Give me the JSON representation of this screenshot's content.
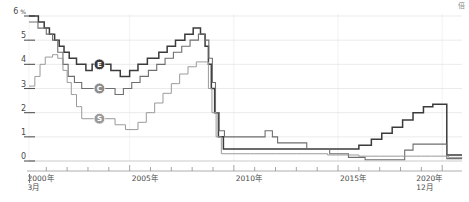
{
  "meta": {
    "corner_mark": "倍"
  },
  "chart_data": {
    "type": "line",
    "title": "",
    "subtitle": "",
    "xlabel": "",
    "ylabel": "%",
    "ylim": [
      0,
      6
    ],
    "xlim": [
      2000.17,
      2020.95
    ],
    "grid": true,
    "legend_position": "inline-markers",
    "y_unit_label": "%",
    "y_ticks": [
      0,
      1,
      2,
      3,
      4,
      5,
      6
    ],
    "y_tick_labels": [
      "0",
      "1",
      "2",
      "3",
      "4",
      "5",
      "6"
    ],
    "x_ticks": [
      2000,
      2001,
      2002,
      2003,
      2004,
      2005,
      2006,
      2007,
      2008,
      2009,
      2010,
      2011,
      2012,
      2013,
      2014,
      2015,
      2016,
      2017,
      2018,
      2019,
      2020
    ],
    "x_tick_labels": [
      {
        "value": 2000,
        "label": "2000年",
        "sub": "3月"
      },
      {
        "value": 2005,
        "label": "2005年",
        "sub": ""
      },
      {
        "value": 2010,
        "label": "2010年",
        "sub": ""
      },
      {
        "value": 2015,
        "label": "2015年",
        "sub": ""
      },
      {
        "value": 2020,
        "label": "2020年",
        "sub": "12月"
      }
    ],
    "markers": [
      {
        "id": "E",
        "label": "E",
        "x": 2003.55,
        "y": 4.0,
        "color": "#3b3b3b"
      },
      {
        "id": "C",
        "label": "C",
        "x": 2003.55,
        "y": 3.0,
        "color": "#8c8c8c"
      },
      {
        "id": "S",
        "label": "S",
        "x": 2003.55,
        "y": 1.75,
        "color": "#9a9a9a"
      }
    ],
    "series": [
      {
        "name": "E",
        "color": "#3b3b3b",
        "width": 1.5,
        "points": [
          [
            2000.17,
            6.0
          ],
          [
            2000.6,
            6.0
          ],
          [
            2000.62,
            5.75
          ],
          [
            2000.85,
            5.75
          ],
          [
            2000.9,
            5.5
          ],
          [
            2001.05,
            5.5
          ],
          [
            2001.15,
            5.25
          ],
          [
            2001.3,
            5.25
          ],
          [
            2001.4,
            5.0
          ],
          [
            2001.55,
            5.0
          ],
          [
            2001.62,
            4.75
          ],
          [
            2001.78,
            4.75
          ],
          [
            2001.85,
            4.5
          ],
          [
            2002.0,
            4.5
          ],
          [
            2002.1,
            4.25
          ],
          [
            2002.3,
            4.25
          ],
          [
            2002.45,
            4.0
          ],
          [
            2002.8,
            4.0
          ],
          [
            2002.9,
            3.75
          ],
          [
            2003.1,
            3.75
          ],
          [
            2003.2,
            4.0
          ],
          [
            2003.55,
            4.0
          ],
          [
            2003.7,
            4.0
          ],
          [
            2004.0,
            4.0
          ],
          [
            2004.1,
            3.75
          ],
          [
            2004.45,
            3.75
          ],
          [
            2004.55,
            3.5
          ],
          [
            2004.9,
            3.5
          ],
          [
            2005.0,
            3.75
          ],
          [
            2005.3,
            3.75
          ],
          [
            2005.4,
            4.0
          ],
          [
            2005.75,
            4.0
          ],
          [
            2005.85,
            4.25
          ],
          [
            2006.3,
            4.25
          ],
          [
            2006.4,
            4.5
          ],
          [
            2006.7,
            4.5
          ],
          [
            2006.8,
            4.75
          ],
          [
            2007.1,
            4.75
          ],
          [
            2007.2,
            5.0
          ],
          [
            2007.55,
            5.0
          ],
          [
            2007.65,
            5.25
          ],
          [
            2007.95,
            5.25
          ],
          [
            2008.05,
            5.5
          ],
          [
            2008.3,
            5.5
          ],
          [
            2008.4,
            5.25
          ],
          [
            2008.55,
            5.25
          ],
          [
            2008.62,
            4.75
          ],
          [
            2008.72,
            4.75
          ],
          [
            2008.78,
            4.0
          ],
          [
            2008.86,
            4.0
          ],
          [
            2008.92,
            3.0
          ],
          [
            2009.0,
            3.0
          ],
          [
            2009.08,
            2.0
          ],
          [
            2009.18,
            2.0
          ],
          [
            2009.26,
            1.0
          ],
          [
            2009.4,
            1.0
          ],
          [
            2009.5,
            0.5
          ],
          [
            2010.0,
            0.5
          ],
          [
            2010.5,
            0.5
          ],
          [
            2011.0,
            0.5
          ],
          [
            2011.5,
            0.5
          ],
          [
            2012.0,
            0.5
          ],
          [
            2012.5,
            0.5
          ],
          [
            2013.0,
            0.5
          ],
          [
            2013.5,
            0.5
          ],
          [
            2014.0,
            0.5
          ],
          [
            2014.5,
            0.5
          ],
          [
            2015.0,
            0.5
          ],
          [
            2015.5,
            0.5
          ],
          [
            2015.9,
            0.5
          ],
          [
            2016.0,
            0.65
          ],
          [
            2016.5,
            0.65
          ],
          [
            2016.6,
            0.9
          ],
          [
            2017.0,
            0.9
          ],
          [
            2017.1,
            1.15
          ],
          [
            2017.5,
            1.15
          ],
          [
            2017.6,
            1.4
          ],
          [
            2018.0,
            1.4
          ],
          [
            2018.1,
            1.7
          ],
          [
            2018.5,
            1.7
          ],
          [
            2018.6,
            2.0
          ],
          [
            2019.0,
            2.0
          ],
          [
            2019.1,
            2.25
          ],
          [
            2019.45,
            2.25
          ],
          [
            2019.55,
            2.35
          ],
          [
            2019.9,
            2.35
          ],
          [
            2020.0,
            2.35
          ],
          [
            2020.18,
            2.35
          ],
          [
            2020.22,
            0.25
          ],
          [
            2020.3,
            0.25
          ],
          [
            2020.4,
            0.25
          ],
          [
            2020.95,
            0.25
          ]
        ]
      },
      {
        "name": "C",
        "color": "#6e6e6e",
        "width": 1.1,
        "points": [
          [
            2000.17,
            5.75
          ],
          [
            2000.5,
            5.75
          ],
          [
            2000.6,
            5.5
          ],
          [
            2000.9,
            5.5
          ],
          [
            2001.0,
            5.25
          ],
          [
            2001.2,
            5.25
          ],
          [
            2001.3,
            5.0
          ],
          [
            2001.45,
            5.0
          ],
          [
            2001.55,
            4.5
          ],
          [
            2001.7,
            4.5
          ],
          [
            2001.8,
            4.0
          ],
          [
            2001.95,
            4.0
          ],
          [
            2002.05,
            3.5
          ],
          [
            2002.25,
            3.5
          ],
          [
            2002.35,
            3.25
          ],
          [
            2002.6,
            3.25
          ],
          [
            2002.7,
            3.0
          ],
          [
            2003.55,
            3.0
          ],
          [
            2003.7,
            3.0
          ],
          [
            2004.2,
            3.0
          ],
          [
            2004.3,
            2.75
          ],
          [
            2004.6,
            2.75
          ],
          [
            2004.7,
            3.0
          ],
          [
            2005.0,
            3.0
          ],
          [
            2005.1,
            3.25
          ],
          [
            2005.4,
            3.25
          ],
          [
            2005.5,
            3.5
          ],
          [
            2005.8,
            3.5
          ],
          [
            2005.9,
            3.75
          ],
          [
            2006.2,
            3.75
          ],
          [
            2006.3,
            4.0
          ],
          [
            2006.6,
            4.0
          ],
          [
            2006.7,
            4.25
          ],
          [
            2007.0,
            4.25
          ],
          [
            2007.1,
            4.5
          ],
          [
            2007.4,
            4.5
          ],
          [
            2007.5,
            4.75
          ],
          [
            2007.8,
            4.75
          ],
          [
            2007.9,
            5.0
          ],
          [
            2008.2,
            5.0
          ],
          [
            2008.3,
            5.25
          ],
          [
            2008.5,
            5.25
          ],
          [
            2008.6,
            5.0
          ],
          [
            2008.72,
            5.0
          ],
          [
            2008.8,
            4.25
          ],
          [
            2008.9,
            4.25
          ],
          [
            2008.97,
            3.25
          ],
          [
            2009.05,
            3.25
          ],
          [
            2009.12,
            2.0
          ],
          [
            2009.22,
            2.0
          ],
          [
            2009.3,
            1.25
          ],
          [
            2009.45,
            1.25
          ],
          [
            2009.55,
            1.0
          ],
          [
            2010.5,
            1.0
          ],
          [
            2011.0,
            1.0
          ],
          [
            2011.4,
            1.0
          ],
          [
            2011.5,
            1.25
          ],
          [
            2011.75,
            1.25
          ],
          [
            2011.85,
            1.0
          ],
          [
            2012.0,
            1.0
          ],
          [
            2012.1,
            0.75
          ],
          [
            2012.6,
            0.75
          ],
          [
            2012.7,
            0.75
          ],
          [
            2013.4,
            0.75
          ],
          [
            2013.5,
            0.5
          ],
          [
            2014.5,
            0.5
          ],
          [
            2014.6,
            0.3
          ],
          [
            2015.4,
            0.3
          ],
          [
            2015.5,
            0.15
          ],
          [
            2016.2,
            0.15
          ],
          [
            2016.3,
            0.05
          ],
          [
            2017.5,
            0.05
          ],
          [
            2017.6,
            0.05
          ],
          [
            2018.1,
            0.05
          ],
          [
            2018.2,
            0.45
          ],
          [
            2018.5,
            0.45
          ],
          [
            2018.6,
            0.7
          ],
          [
            2019.0,
            0.7
          ],
          [
            2019.1,
            0.7
          ],
          [
            2019.9,
            0.7
          ],
          [
            2020.0,
            0.7
          ],
          [
            2020.18,
            0.7
          ],
          [
            2020.22,
            0.1
          ],
          [
            2020.95,
            0.1
          ]
        ]
      },
      {
        "name": "S",
        "color": "#9a9a9a",
        "width": 1.0,
        "points": [
          [
            2000.17,
            3.1
          ],
          [
            2000.35,
            3.1
          ],
          [
            2000.45,
            3.5
          ],
          [
            2000.6,
            3.5
          ],
          [
            2000.7,
            4.0
          ],
          [
            2000.85,
            4.0
          ],
          [
            2000.95,
            4.3
          ],
          [
            2001.2,
            4.3
          ],
          [
            2001.3,
            4.4
          ],
          [
            2001.45,
            4.4
          ],
          [
            2001.55,
            4.25
          ],
          [
            2001.7,
            4.25
          ],
          [
            2001.8,
            3.75
          ],
          [
            2001.9,
            3.75
          ],
          [
            2002.0,
            3.25
          ],
          [
            2002.1,
            3.25
          ],
          [
            2002.2,
            2.75
          ],
          [
            2002.35,
            2.75
          ],
          [
            2002.45,
            2.25
          ],
          [
            2002.6,
            2.25
          ],
          [
            2002.7,
            1.75
          ],
          [
            2003.55,
            1.75
          ],
          [
            2003.8,
            1.75
          ],
          [
            2004.2,
            1.75
          ],
          [
            2004.3,
            1.5
          ],
          [
            2004.7,
            1.5
          ],
          [
            2004.8,
            1.3
          ],
          [
            2005.3,
            1.3
          ],
          [
            2005.4,
            1.6
          ],
          [
            2005.7,
            1.6
          ],
          [
            2005.8,
            2.0
          ],
          [
            2006.1,
            2.0
          ],
          [
            2006.2,
            2.4
          ],
          [
            2006.5,
            2.4
          ],
          [
            2006.6,
            2.8
          ],
          [
            2006.9,
            2.8
          ],
          [
            2007.0,
            3.2
          ],
          [
            2007.3,
            3.2
          ],
          [
            2007.4,
            3.6
          ],
          [
            2007.7,
            3.6
          ],
          [
            2007.8,
            3.9
          ],
          [
            2008.1,
            3.9
          ],
          [
            2008.2,
            4.1
          ],
          [
            2008.45,
            4.1
          ],
          [
            2008.55,
            4.1
          ],
          [
            2008.7,
            4.1
          ],
          [
            2008.78,
            3.0
          ],
          [
            2008.88,
            3.0
          ],
          [
            2008.95,
            2.0
          ],
          [
            2009.05,
            2.0
          ],
          [
            2009.15,
            1.0
          ],
          [
            2009.3,
            1.0
          ],
          [
            2009.4,
            0.3
          ],
          [
            2010.0,
            0.3
          ],
          [
            2010.8,
            0.3
          ],
          [
            2011.0,
            0.3
          ],
          [
            2011.2,
            0.3
          ],
          [
            2012.0,
            0.3
          ],
          [
            2012.5,
            0.3
          ],
          [
            2013.0,
            0.3
          ],
          [
            2013.5,
            0.3
          ],
          [
            2014.0,
            0.3
          ],
          [
            2014.5,
            0.25
          ],
          [
            2015.0,
            0.25
          ],
          [
            2015.5,
            0.25
          ],
          [
            2016.0,
            0.2
          ],
          [
            2016.5,
            0.2
          ],
          [
            2017.0,
            0.2
          ],
          [
            2017.5,
            0.2
          ],
          [
            2018.0,
            0.2
          ],
          [
            2018.5,
            0.2
          ],
          [
            2019.0,
            0.2
          ],
          [
            2019.5,
            0.2
          ],
          [
            2020.0,
            0.2
          ],
          [
            2020.3,
            0.15
          ],
          [
            2020.95,
            0.12
          ]
        ]
      }
    ]
  }
}
